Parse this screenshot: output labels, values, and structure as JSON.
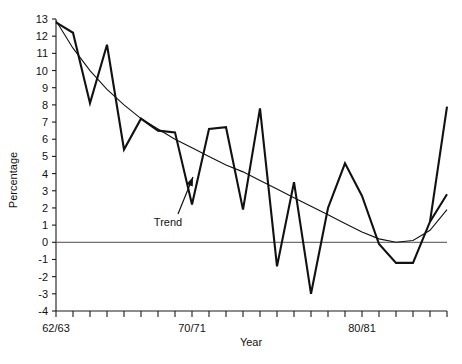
{
  "chart_data": {
    "type": "line",
    "title": "",
    "xlabel": "Year",
    "ylabel": "Percentage",
    "ylim": [
      -4,
      13
    ],
    "xlim": [
      0,
      23
    ],
    "grid": false,
    "legend": "none",
    "y_ticks": [
      13,
      12,
      11,
      10,
      9,
      8,
      7,
      6,
      5,
      4,
      3,
      2,
      1,
      0,
      -1,
      -2,
      -3,
      -4
    ],
    "y_tick_labels": [
      "13",
      "12",
      "11",
      "10",
      "9",
      "8",
      "7",
      "6",
      "5",
      "4",
      "3",
      "2",
      "1",
      "0",
      "-1",
      "-2",
      "-3",
      "-4"
    ],
    "x_ticks": [
      0,
      1,
      2,
      3,
      4,
      5,
      6,
      7,
      8,
      9,
      10,
      11,
      12,
      13,
      14,
      15,
      16,
      17,
      18,
      19,
      20,
      21,
      22,
      23
    ],
    "x_tick_labels": [
      "62/63",
      "",
      "",
      "",
      "",
      "",
      "",
      "",
      "70/71",
      "",
      "",
      "",
      "",
      "",
      "",
      "",
      "",
      "",
      "80/81",
      "",
      "",
      "",
      "",
      ""
    ],
    "zero_line": 0,
    "series": [
      {
        "name": "Percentage",
        "style": "thick",
        "x": [
          0,
          1,
          2,
          3,
          4,
          5,
          6,
          7,
          8,
          9,
          10,
          11,
          12,
          13,
          14,
          15,
          16,
          17,
          18,
          19,
          20,
          21,
          22,
          23
        ],
        "values": [
          12.8,
          12.2,
          8.1,
          11.5,
          5.4,
          7.2,
          6.5,
          6.4,
          2.2,
          6.6,
          6.7,
          1.9,
          7.8,
          -1.4,
          3.5,
          -3.0,
          2.0,
          4.6,
          2.7,
          -0.1,
          -1.2,
          -1.2,
          1.2,
          2.8
        ]
      },
      {
        "name": "Trend",
        "style": "thin",
        "x": [
          0,
          1,
          2,
          3,
          4,
          5,
          6,
          7,
          8,
          9,
          10,
          11,
          12,
          13,
          14,
          15,
          16,
          17,
          18,
          19,
          20,
          21,
          22,
          23
        ],
        "values": [
          12.9,
          11.3,
          10.0,
          8.9,
          8.0,
          7.2,
          6.6,
          6.0,
          5.5,
          5.0,
          4.5,
          4.1,
          3.6,
          3.1,
          2.6,
          2.1,
          1.6,
          1.1,
          0.6,
          0.2,
          0.0,
          0.1,
          0.7,
          1.9
        ]
      }
    ],
    "extra_segment": {
      "note": "tail of thick series after last plotted vertex",
      "x": [
        22,
        23
      ],
      "values": [
        1.2,
        7.9
      ]
    },
    "annotations": [
      {
        "name": "trend-annotation",
        "label": "Trend",
        "label_x": 168,
        "label_y": 226,
        "arrow_from_x": 178,
        "arrow_from_y": 214,
        "arrow_to_x": 193,
        "arrow_to_y": 177
      }
    ]
  },
  "colors": {
    "series": "#111111",
    "trend": "#111111",
    "axis": "#1a1a1a",
    "zero": "#4a4a4a",
    "background": "#ffffff"
  },
  "icons": {
    "arrow": "arrow-up-right-icon"
  }
}
